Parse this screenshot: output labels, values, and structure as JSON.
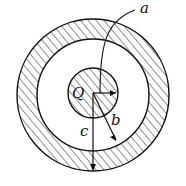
{
  "diagram": {
    "type": "concentric-spheres",
    "labels": {
      "charge": "Q",
      "a": "a",
      "b": "b",
      "c": "c"
    },
    "colors": {
      "stroke": "#111111",
      "background": "#ffffff"
    },
    "regions": [
      {
        "name": "inner-sphere",
        "hatched": true
      },
      {
        "name": "gap",
        "hatched": false
      },
      {
        "name": "outer-shell",
        "hatched": true
      }
    ]
  }
}
